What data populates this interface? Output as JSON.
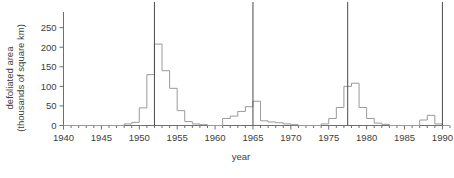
{
  "chart_data": {
    "type": "line",
    "title": "",
    "subtitle": "",
    "xlabel": "year",
    "ylabel": "defoliated area (thousands of square km)",
    "ylabel_line1": "defoliated area",
    "ylabel_line2": "(thousands of square km)",
    "xlim": [
      1940,
      1991
    ],
    "ylim": [
      0,
      290
    ],
    "grid": false,
    "legend": null,
    "legend_position": "none",
    "drawstyle": "steps-post",
    "x_major_ticks": [
      1940,
      1945,
      1950,
      1955,
      1960,
      1965,
      1970,
      1975,
      1980,
      1985,
      1990
    ],
    "x_major_tick_labels": [
      "1940",
      "1945",
      "1950",
      "1955",
      "1960",
      "1965",
      "1970",
      "1975",
      "1980",
      "1985",
      "1990"
    ],
    "x_minor_tick_step": 1,
    "y_major_ticks": [
      0,
      50,
      100,
      150,
      200,
      250
    ],
    "y_major_tick_labels": [
      "0",
      "50",
      "100",
      "150",
      "200",
      "250"
    ],
    "annotations": [
      {
        "name": "outbreak-marker-1952",
        "type": "vertical-line",
        "x": 1952
      },
      {
        "name": "outbreak-marker-1965",
        "type": "vertical-line",
        "x": 1965
      },
      {
        "name": "outbreak-marker-1977",
        "type": "vertical-line",
        "x": 1977.5
      },
      {
        "name": "outbreak-marker-1990",
        "type": "vertical-line",
        "x": 1990
      }
    ],
    "series": [
      {
        "name": "defoliated area",
        "color": "#9a9a9a",
        "x": [
          1940,
          1941,
          1942,
          1943,
          1944,
          1945,
          1946,
          1947,
          1948,
          1949,
          1950,
          1951,
          1952,
          1953,
          1954,
          1955,
          1956,
          1957,
          1958,
          1959,
          1960,
          1961,
          1962,
          1963,
          1964,
          1965,
          1966,
          1967,
          1968,
          1969,
          1970,
          1971,
          1972,
          1973,
          1974,
          1975,
          1976,
          1977,
          1978,
          1979,
          1980,
          1981,
          1982,
          1983,
          1984,
          1985,
          1986,
          1987,
          1988,
          1989,
          1990
        ],
        "values": [
          0,
          0,
          0,
          0,
          0,
          0,
          0,
          0,
          4,
          8,
          45,
          130,
          208,
          140,
          95,
          38,
          10,
          4,
          2,
          0,
          0,
          18,
          24,
          36,
          48,
          62,
          12,
          9,
          7,
          4,
          2,
          0,
          0,
          0,
          4,
          18,
          46,
          100,
          108,
          46,
          18,
          6,
          3,
          0,
          0,
          0,
          0,
          14,
          26,
          4,
          0
        ]
      }
    ]
  }
}
